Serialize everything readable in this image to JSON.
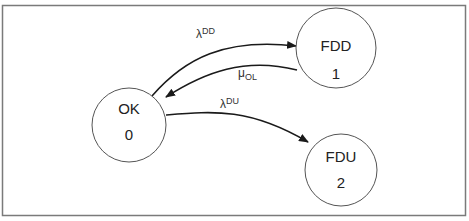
{
  "diagram": {
    "type": "state-transition",
    "frame": {
      "border_color": "#7a7a7a",
      "background": "#ffffff"
    },
    "nodes": [
      {
        "id": "ok",
        "name": "OK",
        "index": "0",
        "cx": 129,
        "cy": 125,
        "r": 37
      },
      {
        "id": "fdd",
        "name": "FDD",
        "index": "1",
        "cx": 336,
        "cy": 48,
        "r": 40
      },
      {
        "id": "fdu",
        "name": "FDU",
        "index": "2",
        "cx": 341,
        "cy": 170,
        "r": 36
      }
    ],
    "edges": [
      {
        "id": "ok-to-fdd",
        "from": "OK",
        "to": "FDD",
        "symbol": "λ",
        "script": "DD",
        "script_position": "superscript"
      },
      {
        "id": "fdd-to-ok",
        "from": "FDD",
        "to": "OK",
        "symbol": "μ",
        "script": "OL",
        "script_position": "subscript"
      },
      {
        "id": "ok-to-fdu",
        "from": "OK",
        "to": "FDU",
        "symbol": "λ",
        "script": "DU",
        "script_position": "superscript"
      }
    ],
    "colors": {
      "stroke": "#222222",
      "circle_stroke": "#555555",
      "text": "#222222"
    }
  }
}
